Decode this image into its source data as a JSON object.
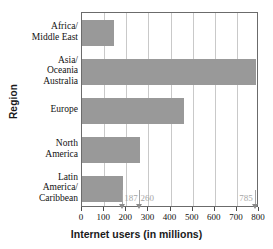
{
  "chart_data": {
    "type": "bar",
    "orientation": "horizontal",
    "title": "",
    "xlabel": "Internet users (in millions)",
    "ylabel": "Region",
    "categories": [
      "Africa/\nMiddle East",
      "Asia/\nOceania\nAustralia",
      "Europe",
      "North\nAmerica",
      "Latin\nAmerica/\nCaribbean"
    ],
    "values": [
      145,
      785,
      460,
      260,
      187
    ],
    "xlim": [
      0,
      800
    ],
    "xticks": [
      0,
      100,
      200,
      300,
      400,
      500,
      600,
      700,
      800
    ],
    "xtick_labels": [
      "0",
      "100",
      "200",
      "300",
      "400",
      "500",
      "600",
      "700",
      "800"
    ],
    "grid": "vertical",
    "legend": "none",
    "bar_color": "#999999",
    "grid_color": "#c9c9c9",
    "frame_color": "#6b6b6b",
    "annotation_color": "#a6a6a6",
    "annotations": [
      {
        "label": "187",
        "value": 187,
        "align": "left"
      },
      {
        "label": "260",
        "value": 260,
        "align": "left"
      },
      {
        "label": "785",
        "value": 785,
        "align": "right"
      }
    ]
  }
}
